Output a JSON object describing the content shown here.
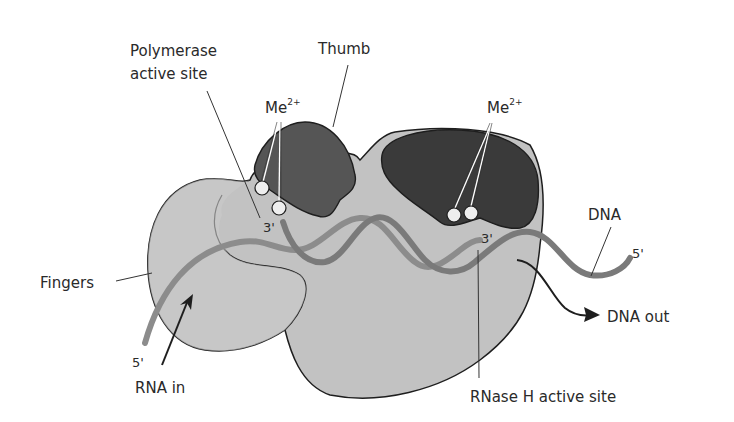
{
  "diagram": {
    "colors": {
      "background": "#ffffff",
      "body_fill": "#c2c2c2",
      "fingers_fill": "#c8c8c8",
      "thumb_fill": "#555555",
      "rnase_fill": "#3a3a3a",
      "outline": "#1e1e1e",
      "strand_dna": "#7a7a7a",
      "strand_rna": "#8c8c8c",
      "metal_ion": "#eeeeee",
      "leader_line": "#333333",
      "text": "#2a2a2a"
    },
    "labels": {
      "polymerase_line1": "Polymerase",
      "polymerase_line2": "active site",
      "thumb": "Thumb",
      "me_left_base": "Me",
      "me_left_sup": "2+",
      "me_right_base": "Me",
      "me_right_sup": "2+",
      "dna": "DNA",
      "dna_5prime": "5'",
      "fingers": "Fingers",
      "rna_5prime": "5'",
      "rna_in": "RNA in",
      "dna_out": "DNA out",
      "rnase_h": "RNase H active site",
      "three_prime_left": "3'",
      "three_prime_right": "3'"
    },
    "components": [
      {
        "name": "Fingers",
        "type": "domain"
      },
      {
        "name": "Thumb",
        "type": "domain"
      },
      {
        "name": "Polymerase active site",
        "type": "site",
        "ions": 2
      },
      {
        "name": "RNase H active site",
        "type": "site",
        "ions": 2
      },
      {
        "name": "RNA",
        "type": "strand",
        "direction": "in",
        "end": "5'"
      },
      {
        "name": "DNA",
        "type": "strand",
        "direction": "out",
        "end": "5'"
      }
    ]
  }
}
